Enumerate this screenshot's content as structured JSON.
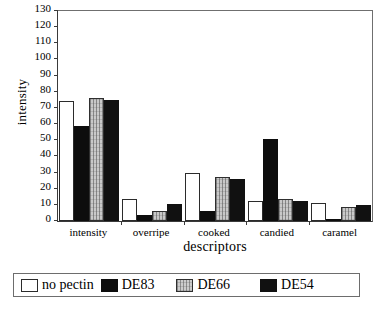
{
  "chart_data": {
    "type": "bar",
    "title": "",
    "xlabel": "descriptors",
    "ylabel": "intensity",
    "categories": [
      "intensity",
      "overripe",
      "cooked",
      "candied",
      "caramel"
    ],
    "series": [
      {
        "name": "no pectin",
        "swatch": "white-outline",
        "values": [
          74,
          13.5,
          30,
          12.5,
          11
        ]
      },
      {
        "name": "DE83",
        "swatch": "solid-black",
        "values": [
          59,
          3.5,
          6,
          50.5,
          1
        ]
      },
      {
        "name": "DE66",
        "swatch": "light-gray-textured",
        "values": [
          76,
          6.5,
          27,
          13.5,
          8.5
        ]
      },
      {
        "name": "DE54",
        "swatch": "solid-black",
        "values": [
          75,
          10.5,
          26,
          12.5,
          10
        ]
      }
    ],
    "ylim": [
      0,
      130
    ],
    "ytick_step": 10,
    "yticks": [
      0,
      10,
      20,
      30,
      40,
      50,
      60,
      70,
      80,
      90,
      100,
      110,
      120,
      130
    ],
    "grid": false,
    "legend_position": "bottom"
  },
  "colors": {
    "series_no_pectin": "#ffffff",
    "series_de83": "#0d0d0d",
    "series_de66": "#c9c9c9",
    "series_de54": "#111111",
    "axis": "#3a3a3a",
    "frame": "#6f6f6f",
    "background": "#ffffff"
  }
}
